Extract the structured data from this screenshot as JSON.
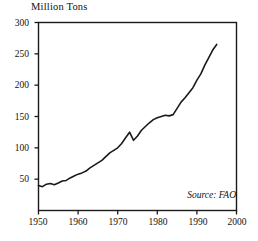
{
  "chart_data": {
    "type": "line",
    "title": "",
    "ylabel": "Million Tons",
    "xlabel": "",
    "source_note": "Source: FAO",
    "grid": false,
    "legend": false,
    "xlim": [
      1950,
      2000
    ],
    "ylim": [
      0,
      300
    ],
    "xticks": [
      1950,
      1960,
      1970,
      1980,
      1990,
      2000
    ],
    "xtick_labels": [
      "1950",
      "1960",
      "1970",
      "1980",
      "1990",
      "2000"
    ],
    "yticks": [
      50,
      100,
      150,
      200,
      250,
      300
    ],
    "ytick_labels": [
      "50",
      "100",
      "150",
      "200",
      "250",
      "300"
    ],
    "line_color": "#1a1a1a",
    "line_width": 1.6,
    "series": [
      {
        "name": "World production",
        "x": [
          1950,
          1951,
          1952,
          1953,
          1954,
          1955,
          1956,
          1957,
          1958,
          1959,
          1960,
          1961,
          1962,
          1963,
          1964,
          1965,
          1966,
          1967,
          1968,
          1969,
          1970,
          1971,
          1972,
          1973,
          1974,
          1975,
          1976,
          1977,
          1978,
          1979,
          1980,
          1981,
          1982,
          1983,
          1984,
          1985,
          1986,
          1987,
          1988,
          1989,
          1990,
          1991,
          1992,
          1993,
          1994,
          1995
        ],
        "values": [
          40,
          38,
          42,
          43,
          41,
          44,
          47,
          48,
          52,
          55,
          58,
          60,
          63,
          68,
          72,
          76,
          80,
          86,
          92,
          96,
          100,
          107,
          116,
          125,
          112,
          119,
          128,
          134,
          140,
          145,
          148,
          150,
          152,
          151,
          153,
          163,
          173,
          180,
          188,
          196,
          208,
          218,
          232,
          244,
          256,
          265
        ]
      }
    ]
  }
}
